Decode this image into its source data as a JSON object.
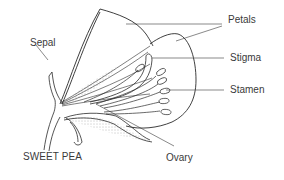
{
  "diagram": {
    "title": "SWEET PEA",
    "labels": {
      "petals": "Petals",
      "stigma": "Stigma",
      "stamen": "Stamen",
      "sepal": "Sepal",
      "ovary": "Ovary"
    },
    "colors": {
      "line": "#2a2a2a",
      "text": "#3a3a3a",
      "background": "#ffffff"
    }
  }
}
